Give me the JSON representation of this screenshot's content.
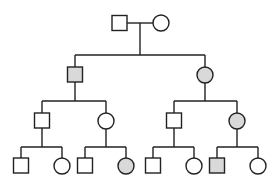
{
  "diagram": {
    "type": "pedigree-chart",
    "colors": {
      "line": "#222222",
      "affected_fill": "#d9d9d9",
      "unaffected_fill": "#ffffff",
      "background": "#ffffff"
    },
    "generations": [
      {
        "id": "I",
        "members": [
          {
            "id": "I-1",
            "sex": "male",
            "affected": false
          },
          {
            "id": "I-2",
            "sex": "female",
            "affected": false
          }
        ]
      },
      {
        "id": "II",
        "members": [
          {
            "id": "II-1",
            "sex": "male",
            "affected": true
          },
          {
            "id": "II-2",
            "sex": "female",
            "affected": true
          }
        ]
      },
      {
        "id": "III",
        "members": [
          {
            "id": "III-1",
            "sex": "male",
            "affected": false
          },
          {
            "id": "III-2",
            "sex": "female",
            "affected": false
          },
          {
            "id": "III-3",
            "sex": "male",
            "affected": false
          },
          {
            "id": "III-4",
            "sex": "female",
            "affected": true
          }
        ]
      },
      {
        "id": "IV",
        "members": [
          {
            "id": "IV-1",
            "sex": "male",
            "affected": false
          },
          {
            "id": "IV-2",
            "sex": "female",
            "affected": false
          },
          {
            "id": "IV-3",
            "sex": "male",
            "affected": false
          },
          {
            "id": "IV-4",
            "sex": "female",
            "affected": true
          },
          {
            "id": "IV-5",
            "sex": "male",
            "affected": false
          },
          {
            "id": "IV-6",
            "sex": "female",
            "affected": false
          },
          {
            "id": "IV-7",
            "sex": "male",
            "affected": true
          },
          {
            "id": "IV-8",
            "sex": "female",
            "affected": false
          }
        ]
      }
    ]
  }
}
